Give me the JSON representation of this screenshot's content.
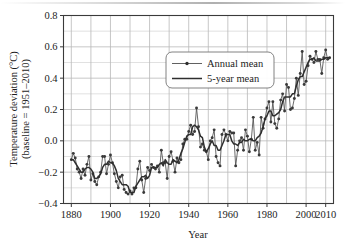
{
  "figure": {
    "name": "global-temperature-deviation-chart",
    "background_color": "#ffffff",
    "ink_color": "#1d1d1d",
    "grid_color": "#b9b9b9",
    "axis_color": "#3a3a3a",
    "series_color": "#4a4a4a",
    "marker_color": "#3a3a3a"
  },
  "chart_data": {
    "type": "line",
    "title": "",
    "xlabel": "Year",
    "ylabel": "Temperature deviation (°C)",
    "ylabel_line2": "(baseline = 1951–2010)",
    "xlim": [
      1876,
      2014
    ],
    "ylim": [
      -0.4,
      0.8
    ],
    "xticks": [
      1880,
      1900,
      1920,
      1940,
      1960,
      1980,
      2000,
      2010
    ],
    "xtick_labels": [
      "1880",
      "1900",
      "1920",
      "1940",
      "1960",
      "1980",
      "2000",
      "2010"
    ],
    "x_minor_step": 10,
    "yticks": [
      -0.4,
      -0.2,
      0.0,
      0.2,
      0.4,
      0.6,
      0.8
    ],
    "ytick_labels": [
      "−0.4",
      "−0.2",
      "0.0",
      "0.2",
      "0.4",
      "0.6",
      "0.8"
    ],
    "y_minor_step": 0.1,
    "grid": true,
    "legend_position": "upper center",
    "legend": [
      {
        "name": "Annual mean",
        "style": "line-with-marker",
        "marker": "circle"
      },
      {
        "name": "5-year mean",
        "style": "line",
        "marker": "none"
      }
    ],
    "x": [
      1880,
      1881,
      1882,
      1883,
      1884,
      1885,
      1886,
      1887,
      1888,
      1889,
      1890,
      1891,
      1892,
      1893,
      1894,
      1895,
      1896,
      1897,
      1898,
      1899,
      1900,
      1901,
      1902,
      1903,
      1904,
      1905,
      1906,
      1907,
      1908,
      1909,
      1910,
      1911,
      1912,
      1913,
      1914,
      1915,
      1916,
      1917,
      1918,
      1919,
      1920,
      1921,
      1922,
      1923,
      1924,
      1925,
      1926,
      1927,
      1928,
      1929,
      1930,
      1931,
      1932,
      1933,
      1934,
      1935,
      1936,
      1937,
      1938,
      1939,
      1940,
      1941,
      1942,
      1943,
      1944,
      1945,
      1946,
      1947,
      1948,
      1949,
      1950,
      1951,
      1952,
      1953,
      1954,
      1955,
      1956,
      1957,
      1958,
      1959,
      1960,
      1961,
      1962,
      1963,
      1964,
      1965,
      1966,
      1967,
      1968,
      1969,
      1970,
      1971,
      1972,
      1973,
      1974,
      1975,
      1976,
      1977,
      1978,
      1979,
      1980,
      1981,
      1982,
      1983,
      1984,
      1985,
      1986,
      1987,
      1988,
      1989,
      1990,
      1991,
      1992,
      1993,
      1994,
      1995,
      1996,
      1997,
      1998,
      1999,
      2000,
      2001,
      2002,
      2003,
      2004,
      2005,
      2006,
      2007,
      2008,
      2009,
      2010,
      2011,
      2012
    ],
    "series": [
      {
        "name": "Annual mean",
        "values": [
          -0.12,
          -0.08,
          -0.11,
          -0.18,
          -0.2,
          -0.24,
          -0.18,
          -0.22,
          -0.15,
          -0.1,
          -0.25,
          -0.21,
          -0.26,
          -0.28,
          -0.23,
          -0.2,
          -0.1,
          -0.1,
          -0.21,
          -0.15,
          -0.09,
          -0.14,
          -0.21,
          -0.26,
          -0.3,
          -0.23,
          -0.22,
          -0.31,
          -0.33,
          -0.34,
          -0.32,
          -0.34,
          -0.3,
          -0.3,
          -0.18,
          -0.13,
          -0.25,
          -0.33,
          -0.24,
          -0.17,
          -0.19,
          -0.15,
          -0.17,
          -0.18,
          -0.16,
          -0.2,
          -0.06,
          -0.14,
          -0.14,
          -0.24,
          -0.1,
          -0.07,
          -0.13,
          -0.2,
          -0.11,
          -0.14,
          -0.12,
          -0.02,
          0.01,
          0.01,
          0.06,
          0.1,
          0.04,
          0.06,
          0.21,
          0.09,
          -0.04,
          -0.02,
          -0.06,
          -0.07,
          -0.12,
          0.0,
          0.02,
          0.07,
          -0.1,
          -0.14,
          -0.16,
          0.04,
          0.07,
          0.04,
          0.0,
          0.06,
          0.05,
          0.05,
          -0.16,
          -0.06,
          0.0,
          0.02,
          -0.06,
          0.07,
          0.03,
          -0.07,
          0.01,
          0.15,
          -0.06,
          -0.01,
          -0.09,
          0.15,
          0.08,
          0.14,
          0.21,
          0.25,
          0.12,
          0.25,
          0.11,
          0.08,
          0.14,
          0.26,
          0.3,
          0.19,
          0.36,
          0.34,
          0.2,
          0.21,
          0.27,
          0.4,
          0.29,
          0.43,
          0.57,
          0.36,
          0.38,
          0.48,
          0.54,
          0.52,
          0.5,
          0.57,
          0.52,
          0.52,
          0.43,
          0.53,
          0.58,
          0.52,
          0.53
        ]
      },
      {
        "name": "5-year mean",
        "values": [
          -0.12,
          -0.12,
          -0.14,
          -0.16,
          -0.18,
          -0.2,
          -0.2,
          -0.18,
          -0.17,
          -0.17,
          -0.18,
          -0.2,
          -0.24,
          -0.24,
          -0.23,
          -0.21,
          -0.17,
          -0.15,
          -0.15,
          -0.13,
          -0.14,
          -0.14,
          -0.16,
          -0.19,
          -0.24,
          -0.26,
          -0.28,
          -0.28,
          -0.28,
          -0.29,
          -0.33,
          -0.33,
          -0.33,
          -0.29,
          -0.27,
          -0.25,
          -0.23,
          -0.23,
          -0.22,
          -0.24,
          -0.22,
          -0.17,
          -0.17,
          -0.17,
          -0.17,
          -0.15,
          -0.14,
          -0.16,
          -0.12,
          -0.14,
          -0.15,
          -0.15,
          -0.12,
          -0.13,
          -0.14,
          -0.12,
          -0.08,
          -0.05,
          -0.01,
          0.03,
          0.04,
          0.04,
          0.09,
          0.1,
          0.09,
          0.07,
          0.03,
          0.02,
          -0.04,
          -0.07,
          -0.05,
          -0.02,
          0.0,
          -0.03,
          -0.03,
          -0.06,
          -0.06,
          -0.03,
          0.0,
          0.04,
          0.04,
          0.04,
          0.0,
          -0.02,
          -0.02,
          -0.03,
          -0.01,
          -0.01,
          0.01,
          0.0,
          0.0,
          0.01,
          0.01,
          0.0,
          0.0,
          0.02,
          0.03,
          0.05,
          0.09,
          0.14,
          0.16,
          0.19,
          0.19,
          0.16,
          0.16,
          0.17,
          0.18,
          0.2,
          0.25,
          0.28,
          0.28,
          0.28,
          0.28,
          0.3,
          0.3,
          0.35,
          0.39,
          0.41,
          0.41,
          0.44,
          0.47,
          0.5,
          0.52,
          0.52,
          0.53,
          0.51,
          0.51,
          0.51,
          0.52,
          0.52,
          0.53,
          0.53,
          0.53
        ]
      }
    ]
  }
}
